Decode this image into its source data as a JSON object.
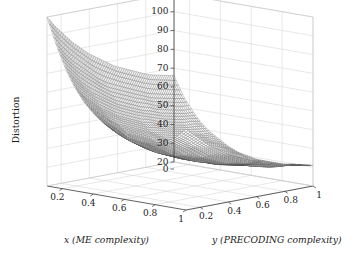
{
  "figure": {
    "kind": "matlab-mesh-surface",
    "background": "#ffffff",
    "axis_color": "#3a3a3a",
    "grid_color": "#d8d8d8",
    "mesh_color": "#555555"
  },
  "chart_data": {
    "type": "surface",
    "title": "",
    "xlabel": "x (ME complexity)",
    "ylabel": "y (PRECODING complexity)",
    "zlabel": "Distortion",
    "grid": true,
    "legend": "none",
    "xlim": [
      0.1,
      1.0
    ],
    "ylim": [
      0.1,
      1.0
    ],
    "zlim": [
      20,
      110
    ],
    "xticks": [
      0.2,
      0.4,
      0.6,
      0.8,
      1
    ],
    "xtick_labels": [
      "0.2",
      "0.4",
      "0.6",
      "0.8",
      "1"
    ],
    "yticks": [
      0.2,
      0.4,
      0.6,
      0.8,
      1
    ],
    "ytick_labels": [
      "0.2",
      "0.4",
      "0.6",
      "0.8",
      "1"
    ],
    "zticks": [
      0,
      20,
      30,
      40,
      50,
      60,
      70,
      80,
      90,
      100,
      110
    ],
    "ztick_labels": [
      "0",
      "20",
      "30",
      "40",
      "50",
      "60",
      "70",
      "80",
      "90",
      "100",
      "110"
    ],
    "x": [
      0.1,
      0.16,
      0.22,
      0.28,
      0.34,
      0.4,
      0.46,
      0.52,
      0.58,
      0.64,
      0.7,
      0.76,
      0.82,
      0.88,
      0.94,
      1.0
    ],
    "y": [
      0.1,
      0.16,
      0.22,
      0.28,
      0.34,
      0.4,
      0.46,
      0.52,
      0.58,
      0.64,
      0.7,
      0.76,
      0.82,
      0.88,
      0.94,
      1.0
    ],
    "z_note": "Distortion z(x,y): steep convex decay in x, mild decay in y; ridge rises near x=1 at low y.",
    "z": [
      [
        110,
        96,
        84,
        75,
        68,
        63,
        59,
        56,
        54,
        53,
        52,
        52,
        53,
        55,
        58,
        63
      ],
      [
        104,
        90,
        79,
        70,
        64,
        59,
        55,
        52,
        50,
        49,
        49,
        49,
        50,
        52,
        55,
        59
      ],
      [
        99,
        85,
        74,
        66,
        60,
        55,
        52,
        49,
        47,
        46,
        46,
        46,
        47,
        49,
        51,
        55
      ],
      [
        94,
        81,
        70,
        62,
        56,
        52,
        48,
        46,
        44,
        43,
        43,
        43,
        44,
        46,
        48,
        51
      ],
      [
        90,
        77,
        67,
        59,
        53,
        49,
        46,
        43,
        42,
        41,
        41,
        41,
        42,
        43,
        45,
        48
      ],
      [
        86,
        73,
        64,
        56,
        51,
        47,
        44,
        41,
        40,
        39,
        39,
        39,
        40,
        41,
        43,
        45
      ],
      [
        83,
        70,
        61,
        54,
        49,
        45,
        42,
        40,
        38,
        37,
        37,
        37,
        38,
        39,
        41,
        43
      ],
      [
        80,
        68,
        59,
        52,
        47,
        43,
        40,
        38,
        37,
        36,
        36,
        36,
        36,
        37,
        39,
        41
      ],
      [
        77,
        66,
        57,
        50,
        45,
        42,
        39,
        37,
        35,
        34,
        34,
        34,
        35,
        36,
        37,
        39
      ],
      [
        75,
        64,
        55,
        49,
        44,
        40,
        38,
        36,
        34,
        33,
        33,
        33,
        34,
        35,
        36,
        38
      ],
      [
        73,
        62,
        54,
        47,
        43,
        39,
        37,
        35,
        33,
        32,
        32,
        32,
        33,
        33,
        35,
        36
      ],
      [
        71,
        60,
        52,
        46,
        42,
        38,
        36,
        34,
        32,
        31,
        31,
        31,
        32,
        32,
        33,
        35
      ],
      [
        69,
        59,
        51,
        45,
        41,
        37,
        35,
        33,
        32,
        31,
        30,
        30,
        31,
        31,
        32,
        34
      ],
      [
        68,
        58,
        50,
        44,
        40,
        37,
        34,
        32,
        31,
        30,
        30,
        30,
        30,
        31,
        32,
        33
      ],
      [
        67,
        57,
        49,
        44,
        39,
        36,
        34,
        32,
        30,
        29,
        29,
        29,
        29,
        30,
        31,
        32
      ],
      [
        66,
        56,
        49,
        43,
        39,
        36,
        33,
        31,
        30,
        29,
        29,
        29,
        29,
        30,
        30,
        31
      ]
    ]
  }
}
